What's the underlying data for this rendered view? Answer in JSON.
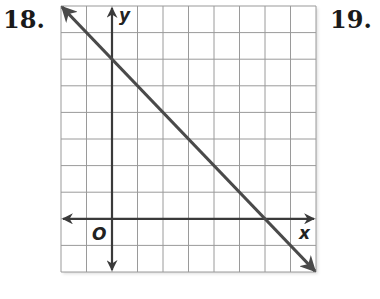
{
  "problems": {
    "current": "18.",
    "next": "19."
  },
  "chart_data": {
    "type": "line",
    "title": "",
    "xlabel": "x",
    "ylabel": "y",
    "origin_label": "O",
    "grid": true,
    "xlim": [
      -2,
      8
    ],
    "ylim": [
      -2,
      8
    ],
    "grid_step": 1,
    "tick_labels": false,
    "series": [
      {
        "name": "line",
        "equation": "y = -x + 6",
        "slope": -1,
        "y_intercept": 6,
        "x_intercept": 6,
        "x": [
          -2,
          0,
          6,
          8
        ],
        "y": [
          8,
          6,
          0,
          -2
        ],
        "arrows": "both"
      }
    ]
  },
  "colors": {
    "grid": "#9a9a9a",
    "axes": "#3a3a3a",
    "line": "#4a4a4a"
  }
}
